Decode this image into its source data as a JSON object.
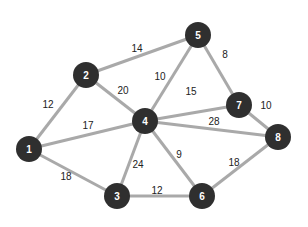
{
  "diagram": {
    "type": "weighted-undirected-graph",
    "colors": {
      "node_fill": "#2f2f2f",
      "node_text": "#ffffff",
      "edge": "#a9a9a9",
      "weight_text": "#222222",
      "background": "#ffffff"
    },
    "nodes": [
      {
        "id": "1",
        "label": "1",
        "x": 29,
        "y": 149
      },
      {
        "id": "2",
        "label": "2",
        "x": 86,
        "y": 75
      },
      {
        "id": "3",
        "label": "3",
        "x": 117,
        "y": 196
      },
      {
        "id": "4",
        "label": "4",
        "x": 145,
        "y": 121
      },
      {
        "id": "5",
        "label": "5",
        "x": 198,
        "y": 35
      },
      {
        "id": "6",
        "label": "6",
        "x": 202,
        "y": 196
      },
      {
        "id": "7",
        "label": "7",
        "x": 239,
        "y": 105
      },
      {
        "id": "8",
        "label": "8",
        "x": 278,
        "y": 137
      }
    ],
    "edges": [
      {
        "from": "1",
        "to": "2",
        "weight": "12",
        "lx": 48,
        "ly": 104
      },
      {
        "from": "1",
        "to": "4",
        "weight": "17",
        "lx": 88,
        "ly": 125
      },
      {
        "from": "1",
        "to": "3",
        "weight": "18",
        "lx": 66,
        "ly": 176
      },
      {
        "from": "2",
        "to": "5",
        "weight": "14",
        "lx": 137,
        "ly": 48
      },
      {
        "from": "2",
        "to": "4",
        "weight": "20",
        "lx": 123,
        "ly": 90
      },
      {
        "from": "4",
        "to": "5",
        "weight": "10",
        "lx": 160,
        "ly": 76
      },
      {
        "from": "5",
        "to": "7",
        "weight": "8",
        "lx": 225,
        "ly": 54
      },
      {
        "from": "4",
        "to": "7",
        "weight": "15",
        "lx": 191,
        "ly": 91
      },
      {
        "from": "7",
        "to": "8",
        "weight": "10",
        "lx": 266,
        "ly": 105
      },
      {
        "from": "4",
        "to": "8",
        "weight": "28",
        "lx": 214,
        "ly": 121
      },
      {
        "from": "3",
        "to": "4",
        "weight": "24",
        "lx": 138,
        "ly": 164
      },
      {
        "from": "4",
        "to": "6",
        "weight": "9",
        "lx": 179,
        "ly": 154
      },
      {
        "from": "3",
        "to": "6",
        "weight": "12",
        "lx": 157,
        "ly": 190
      },
      {
        "from": "6",
        "to": "8",
        "weight": "18",
        "lx": 234,
        "ly": 162
      }
    ]
  }
}
